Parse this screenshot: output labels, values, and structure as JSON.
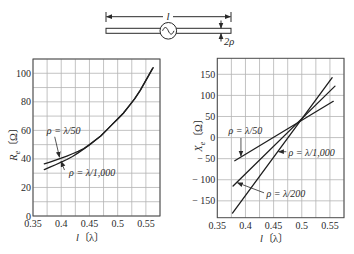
{
  "diagram": {
    "length_label": "l",
    "radius_label": "2ρ",
    "source": "ac-source-icon"
  },
  "chart_data": [
    {
      "type": "line",
      "title": "",
      "xlabel": "l〔λ〕",
      "xlabel_main": "l",
      "xlabel_unit": "〔λ〕",
      "ylabel": "Rₑ〔Ω〕",
      "ylabel_main": "R",
      "ylabel_sub": "e",
      "ylabel_unit": "〔Ω〕",
      "xlim": [
        0.35,
        0.575
      ],
      "ylim": [
        0,
        110
      ],
      "grid": true,
      "grid_step": {
        "x": 0.025,
        "y": 10
      },
      "xticks": [
        0.35,
        0.4,
        0.45,
        0.5,
        0.55
      ],
      "xtick_labels": [
        "0.35",
        "0.4",
        "0.45",
        "0.5",
        "0.55"
      ],
      "yticks": [
        0,
        20,
        40,
        60,
        80,
        100
      ],
      "ytick_labels": [
        "0",
        "20",
        "40",
        "60",
        "80",
        "100"
      ],
      "series": [
        {
          "name": "ρ = λ/50",
          "x": [
            0.37,
            0.38,
            0.39,
            0.4,
            0.41,
            0.42,
            0.43,
            0.44,
            0.45,
            0.46,
            0.47,
            0.48,
            0.49,
            0.5,
            0.51,
            0.52,
            0.53,
            0.54,
            0.55,
            0.56,
            0.563
          ],
          "y": [
            36.5,
            37.8,
            39.1,
            40.5,
            42.0,
            43.6,
            45.3,
            47.2,
            50,
            53,
            56,
            60,
            64,
            68,
            72,
            77,
            82,
            88,
            95,
            102,
            104
          ]
        },
        {
          "name": "ρ = λ/1,000",
          "x": [
            0.37,
            0.38,
            0.39,
            0.4,
            0.41,
            0.42,
            0.43,
            0.44,
            0.45,
            0.46,
            0.47,
            0.48,
            0.49,
            0.5,
            0.51,
            0.52,
            0.53,
            0.54,
            0.55,
            0.56,
            0.562
          ],
          "y": [
            32.5,
            34.2,
            35.9,
            37.7,
            39.6,
            41.7,
            44.2,
            46.9,
            49.8,
            52.9,
            56,
            60,
            64,
            68,
            72,
            77,
            82,
            88,
            95,
            102,
            103.5
          ]
        }
      ],
      "annotations": [
        {
          "text": "ρ = λ/50",
          "x": 0.3745,
          "y": 57.5,
          "from": [
            0.3885,
            55.5
          ],
          "to": [
            0.397,
            41.2
          ]
        },
        {
          "text": "ρ = λ/1,000",
          "x": 0.414,
          "y": 28,
          "from": [
            0.4058,
            32.2
          ],
          "to": [
            0.3998,
            38.3
          ]
        }
      ]
    },
    {
      "type": "line",
      "title": "",
      "xlabel": "l〔λ〕",
      "xlabel_main": "l",
      "xlabel_unit": "〔λ〕",
      "ylabel": "Xₑ〔Ω〕",
      "ylabel_main": "X",
      "ylabel_sub": "e",
      "ylabel_unit": "〔Ω〕",
      "xlim": [
        0.35,
        0.575
      ],
      "ylim": [
        -190,
        188
      ],
      "grid": true,
      "grid_step": {
        "x": 0.025,
        "y": 50
      },
      "xticks": [
        0.35,
        0.4,
        0.45,
        0.5,
        0.55
      ],
      "xtick_labels": [
        "0.35",
        "0.4",
        "0.45",
        "0.5",
        "0.55"
      ],
      "yticks": [
        -150,
        -100,
        -50,
        0,
        50,
        100,
        150
      ],
      "ytick_labels": [
        "− 150",
        "− 100",
        "− 50",
        "0",
        "50",
        "100",
        "150"
      ],
      "series": [
        {
          "name": "ρ = λ/50",
          "x": [
            0.381,
            0.556
          ],
          "y": [
            -55,
            86
          ]
        },
        {
          "name": "ρ = λ/200",
          "x": [
            0.378,
            0.559
          ],
          "y": [
            -115,
            122
          ]
        },
        {
          "name": "ρ = λ/1,000",
          "x": [
            0.377,
            0.554
          ],
          "y": [
            -179,
            142
          ]
        }
      ],
      "annotations": [
        {
          "text": "ρ = λ/50",
          "x": 0.37,
          "y": 7.5,
          "from": [
            0.392,
            -1
          ],
          "to": [
            0.392,
            -44
          ]
        },
        {
          "text": "ρ = λ/1,000",
          "x": 0.4765,
          "y": -42.5,
          "from": [
            0.4725,
            -33.5
          ],
          "to": [
            0.4585,
            -33.5
          ]
        },
        {
          "text": "ρ = λ/200",
          "x": 0.4375,
          "y": -140.5,
          "from": [
            0.433,
            -131
          ],
          "to": [
            0.3855,
            -107
          ]
        }
      ]
    }
  ]
}
